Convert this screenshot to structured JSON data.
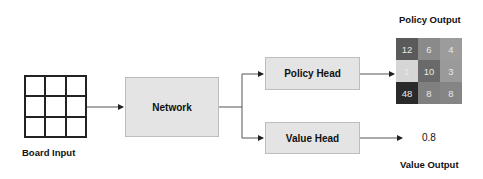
{
  "board_input": {
    "label": "Board Input",
    "rows": 3,
    "cols": 3
  },
  "network": {
    "label": "Network"
  },
  "heads": {
    "policy": {
      "label": "Policy Head"
    },
    "value": {
      "label": "Value Head"
    }
  },
  "policy_output": {
    "title": "Policy Output",
    "cells": [
      {
        "value": "12",
        "color": "#5a5a5a"
      },
      {
        "value": "6",
        "color": "#8a8a8a"
      },
      {
        "value": "4",
        "color": "#9c9c9c"
      },
      {
        "value": "1",
        "color": "#d6d6d6"
      },
      {
        "value": "10",
        "color": "#6a6a6a"
      },
      {
        "value": "3",
        "color": "#9a9a9a"
      },
      {
        "value": "48",
        "color": "#2a2a2a"
      },
      {
        "value": "8",
        "color": "#808080"
      },
      {
        "value": "8",
        "color": "#858585"
      }
    ]
  },
  "value_output": {
    "title": "Value Output",
    "value": "0.8"
  },
  "colors": {
    "box_fill": "#e4e4e4",
    "box_border": "#bdbdbd",
    "line": "#555555"
  }
}
